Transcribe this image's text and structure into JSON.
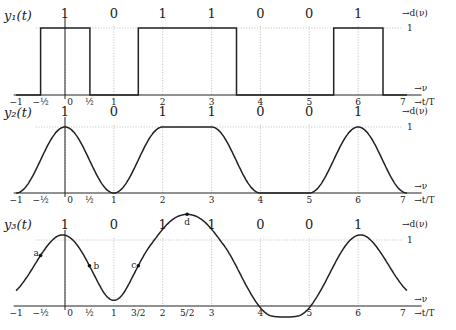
{
  "diagram": {
    "x_axis": {
      "ticks": [
        -1,
        -0.5,
        0,
        0.5,
        1,
        2,
        3,
        4,
        5,
        6,
        7
      ],
      "tick_labels_1_2": [
        "−1",
        "−½",
        "0",
        "½",
        "1",
        "2",
        "3",
        "4",
        "5",
        "6",
        "7"
      ],
      "tick_labels_3": [
        "−1",
        "−½",
        "0",
        "½",
        "1",
        "3/2",
        "2",
        "5/2",
        "3",
        "4",
        "5",
        "6",
        "7"
      ],
      "nu_label": "→ν",
      "t_label": "→t/T"
    },
    "bits": [
      "1",
      "0",
      "1",
      "1",
      "0",
      "0",
      "1"
    ],
    "d_label": "→d(ν)",
    "level_label": "1",
    "panels": [
      {
        "name": "y1",
        "label": "y₁(t)",
        "shape": "rectangular NRZ pulses, width T centered at ν"
      },
      {
        "name": "y2",
        "label": "y₂(t)",
        "shape": "raised-cosine pulses of width 2T"
      },
      {
        "name": "y3",
        "label": "y₃(t)",
        "shape": "smoothed signal with overshoot and undershoot"
      }
    ],
    "points": [
      {
        "name": "a",
        "t": -0.5
      },
      {
        "name": "b",
        "t": 0.5
      },
      {
        "name": "c",
        "t": 1.5
      },
      {
        "name": "d",
        "t": 2.5
      }
    ]
  }
}
